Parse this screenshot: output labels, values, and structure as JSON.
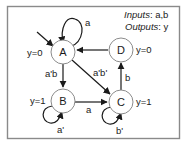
{
  "diagram": {
    "type": "finite-state-machine",
    "legend": {
      "inputs_label": "Inputs",
      "inputs_value": ": a,b",
      "outputs_label": "Outputs",
      "outputs_value": ": y"
    },
    "states": [
      {
        "id": "A",
        "label": "A",
        "output": "y=0",
        "initial": true
      },
      {
        "id": "B",
        "label": "B",
        "output": "y=1",
        "initial": false
      },
      {
        "id": "C",
        "label": "C",
        "output": "y=1",
        "initial": false
      },
      {
        "id": "D",
        "label": "D",
        "output": "y=0",
        "initial": false
      }
    ],
    "transitions": [
      {
        "from": "A",
        "to": "A",
        "label": "a"
      },
      {
        "from": "A",
        "to": "B",
        "label": "a'b"
      },
      {
        "from": "A",
        "to": "C",
        "label": "a'b'"
      },
      {
        "from": "B",
        "to": "B",
        "label": "a'"
      },
      {
        "from": "B",
        "to": "C",
        "label": "a"
      },
      {
        "from": "C",
        "to": "C",
        "label": "b'"
      },
      {
        "from": "C",
        "to": "D",
        "label": "b"
      },
      {
        "from": "D",
        "to": "A",
        "label": ""
      }
    ]
  },
  "colors": {
    "frame": "#8a8a8a",
    "node_stroke": "#8c8c8c",
    "edge": "#1a1a1a",
    "text": "#1a1a1a",
    "background": "#ffffff"
  }
}
